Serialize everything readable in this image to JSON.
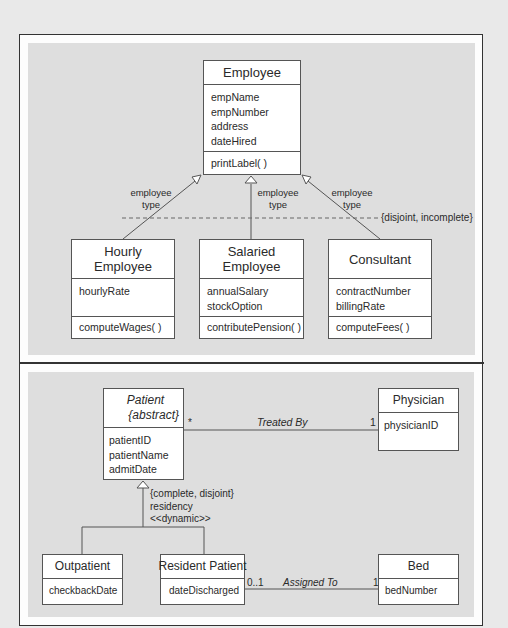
{
  "top_diagram": {
    "superclass": {
      "name": "Employee",
      "attributes": [
        "empName",
        "empNumber",
        "address",
        "dateHired"
      ],
      "operations": [
        "printLabel( )"
      ]
    },
    "discriminator_labels": [
      {
        "line1": "employee",
        "line2": "type"
      },
      {
        "line1": "employee",
        "line2": "type"
      },
      {
        "line1": "employee",
        "line2": "type"
      }
    ],
    "constraint": "{disjoint, incomplete}",
    "subclasses": [
      {
        "name_line1": "Hourly",
        "name_line2": "Employee",
        "attributes": [
          "hourlyRate"
        ],
        "operations": [
          "computeWages( )"
        ]
      },
      {
        "name_line1": "Salaried",
        "name_line2": "Employee",
        "attributes": [
          "annualSalary",
          "stockOption"
        ],
        "operations": [
          "contributePension( )"
        ]
      },
      {
        "name_line1": "Consultant",
        "name_line2": "",
        "attributes": [
          "contractNumber",
          "billingRate"
        ],
        "operations": [
          "computeFees( )"
        ]
      }
    ]
  },
  "bottom_diagram": {
    "patient": {
      "name": "Patient",
      "stereotype": "{abstract}",
      "attributes": [
        "patientID",
        "patientName",
        "admitDate"
      ]
    },
    "physician": {
      "name": "Physician",
      "attributes": [
        "physicianID"
      ]
    },
    "treated_by": {
      "label": "Treated By",
      "patient_multiplicity": "*",
      "physician_multiplicity": "1"
    },
    "generalization": {
      "constraint": "{complete, disjoint}",
      "discriminator": "residency",
      "stereotype": "<<dynamic>>"
    },
    "outpatient": {
      "name": "Outpatient",
      "attributes": [
        "checkbackDate"
      ]
    },
    "resident_patient": {
      "name": "Resident Patient",
      "attributes": [
        "dateDischarged"
      ]
    },
    "bed": {
      "name": "Bed",
      "attributes": [
        "bedNumber"
      ]
    },
    "assigned_to": {
      "label": "Assigned To",
      "resident_multiplicity": "0..1",
      "bed_multiplicity": "1"
    }
  },
  "colors": {
    "page_bg": "#e9e9e9",
    "panel_bg": "#dedede",
    "box_bg": "#ffffff",
    "line": "#555555"
  }
}
